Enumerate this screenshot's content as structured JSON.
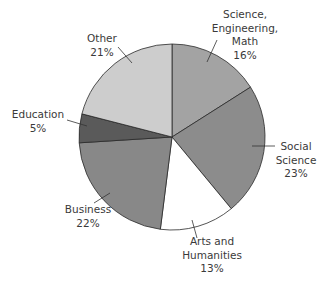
{
  "chart_data": {
    "type": "pie",
    "title": "",
    "start_angle_deg": 0,
    "direction": "clockwise",
    "categories": [
      "Science, Engineering, Math",
      "Social Science",
      "Arts and Humanities",
      "Business",
      "Education",
      "Other"
    ],
    "values": [
      16,
      23,
      13,
      22,
      5,
      21
    ],
    "unit": "%",
    "colors": [
      "#a3a3a3",
      "#8c8c8c",
      "#ffffff",
      "#888888",
      "#5a5a5a",
      "#cdcdcd"
    ],
    "labels": [
      {
        "lines": [
          "Science,",
          "Engineering,",
          "Math",
          "16%"
        ]
      },
      {
        "lines": [
          "Social",
          "Science",
          "23%"
        ]
      },
      {
        "lines": [
          "Arts and",
          "Humanities",
          "13%"
        ]
      },
      {
        "lines": [
          "Business",
          "22%"
        ]
      },
      {
        "lines": [
          "Education",
          "5%"
        ]
      },
      {
        "lines": [
          "Other",
          "21%"
        ]
      }
    ],
    "legend": "none (direct labels with leader lines)"
  }
}
